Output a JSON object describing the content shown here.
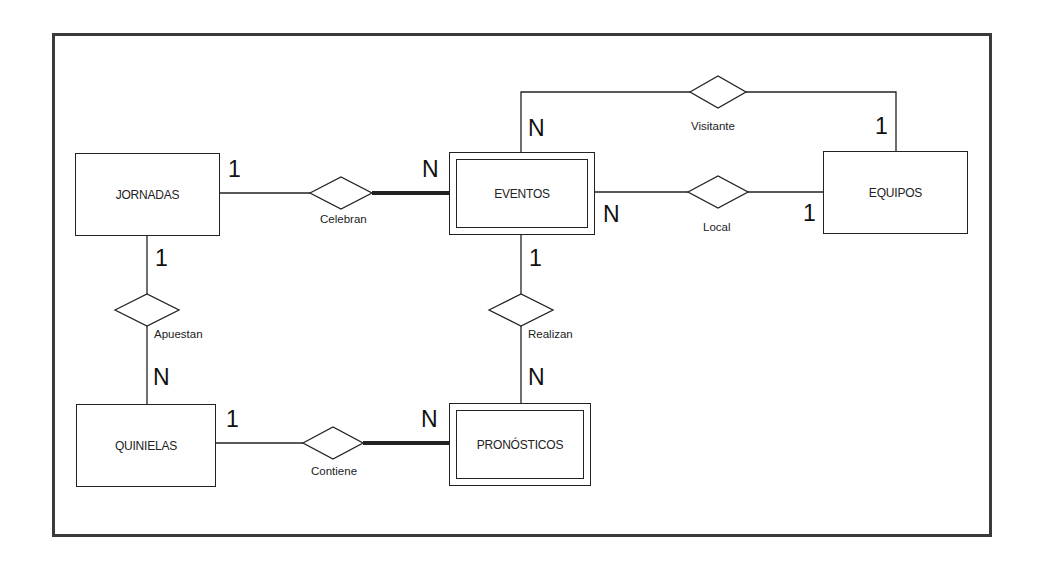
{
  "diagram": {
    "type": "entity-relationship",
    "entities": [
      {
        "id": "jornadas",
        "label": "JORNADAS",
        "weak": false
      },
      {
        "id": "eventos",
        "label": "EVENTOS",
        "weak": true
      },
      {
        "id": "equipos",
        "label": "EQUIPOS",
        "weak": false
      },
      {
        "id": "quinielas",
        "label": "QUINIELAS",
        "weak": false
      },
      {
        "id": "pronosticos",
        "label": "PRONÓSTICOS",
        "weak": true
      }
    ],
    "relationships": [
      {
        "id": "celebran",
        "label": "Celebran",
        "from": "JORNADAS",
        "from_card": "1",
        "to": "EVENTOS",
        "to_card": "N",
        "identifying": true
      },
      {
        "id": "visitante",
        "label": "Visitante",
        "from": "EVENTOS",
        "from_card": "N",
        "to": "EQUIPOS",
        "to_card": "1",
        "identifying": false
      },
      {
        "id": "local",
        "label": "Local",
        "from": "EVENTOS",
        "from_card": "N",
        "to": "EQUIPOS",
        "to_card": "1",
        "identifying": false
      },
      {
        "id": "apuestan",
        "label": "Apuestan",
        "from": "JORNADAS",
        "from_card": "1",
        "to": "QUINIELAS",
        "to_card": "N",
        "identifying": false
      },
      {
        "id": "realizan",
        "label": "Realizan",
        "from": "EVENTOS",
        "from_card": "1",
        "to": "PRONÓSTICOS",
        "to_card": "N",
        "identifying": false
      },
      {
        "id": "contiene",
        "label": "Contiene",
        "from": "QUINIELAS",
        "from_card": "1",
        "to": "PRONÓSTICOS",
        "to_card": "N",
        "identifying": true
      }
    ]
  },
  "colors": {
    "line": "#222222",
    "frame": "#3a3a3a",
    "background": "#ffffff"
  }
}
